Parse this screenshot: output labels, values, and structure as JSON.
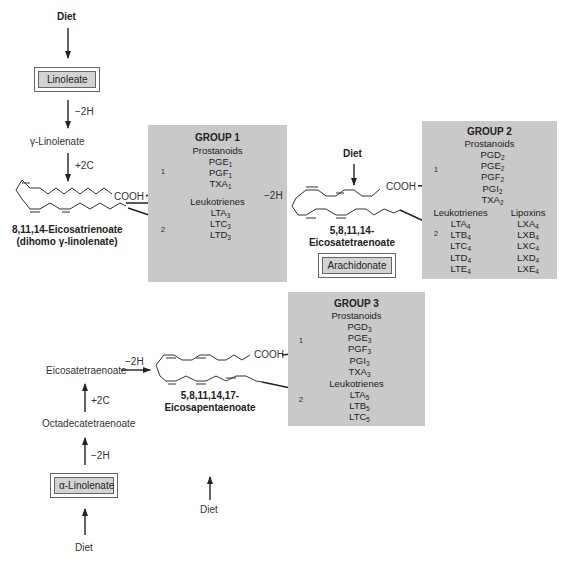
{
  "pathway_1": {
    "diet_top": "Diet",
    "linoleate": "Linoleate",
    "step1": "−2H",
    "gamma_linolenate": "γ-Linolenate",
    "step2": "+2C",
    "cooh": "COOH",
    "molecule_name_1": "8,11,14-Eicosatrienoate",
    "molecule_name_2": "(dihomo γ-linolenate)",
    "step3": "−2H"
  },
  "pathway_2": {
    "diet": "Diet",
    "cooh": "COOH",
    "molecule_name_1": "5,8,11,14-",
    "molecule_name_2": "Eicosatetraenoate",
    "arachidonate": "Arachidonate"
  },
  "pathway_3": {
    "diet_bottom": "Diet",
    "alpha_linolenate": "α-Linolenate",
    "step1": "−2H",
    "octadecatetraenoate": "Octadecatetraenoate",
    "step2": "+2C",
    "eicosatetraenoate": "Eicosatetraenoate",
    "step3": "−2H",
    "cooh": "COOH",
    "molecule_name_1": "5,8,11,14,17-",
    "molecule_name_2": "Eicosapentaenoate",
    "diet_mid": "Diet"
  },
  "route_labels": {
    "one": "1",
    "two": "2"
  },
  "group1": {
    "title": "GROUP 1",
    "prostanoids_label": "Prostanoids",
    "prostanoids": [
      {
        "base": "PGE",
        "sub": "1"
      },
      {
        "base": "PGF",
        "sub": "1"
      },
      {
        "base": "TXA",
        "sub": "1"
      }
    ],
    "leukotrienes_label": "Leukotrienes",
    "leukotrienes": [
      {
        "base": "LTA",
        "sub": "3"
      },
      {
        "base": "LTC",
        "sub": "3"
      },
      {
        "base": "LTD",
        "sub": "3"
      }
    ]
  },
  "group2": {
    "title": "GROUP 2",
    "prostanoids_label": "Prostanoids",
    "prostanoids": [
      {
        "base": "PGD",
        "sub": "2"
      },
      {
        "base": "PGE",
        "sub": "2"
      },
      {
        "base": "PGF",
        "sub": "2"
      },
      {
        "base": "PGI",
        "sub": "2"
      },
      {
        "base": "TXA",
        "sub": "2"
      }
    ],
    "leukotrienes_label": "Leukotrienes",
    "leukotrienes": [
      {
        "base": "LTA",
        "sub": "4"
      },
      {
        "base": "LTB",
        "sub": "4"
      },
      {
        "base": "LTC",
        "sub": "4"
      },
      {
        "base": "LTD",
        "sub": "4"
      },
      {
        "base": "LTE",
        "sub": "4"
      }
    ],
    "lipoxins_label": "Lipoxins",
    "lipoxins": [
      {
        "base": "LXA",
        "sub": "4"
      },
      {
        "base": "LXB",
        "sub": "4"
      },
      {
        "base": "LXC",
        "sub": "4"
      },
      {
        "base": "LXD",
        "sub": "4"
      },
      {
        "base": "LXE",
        "sub": "4"
      }
    ]
  },
  "group3": {
    "title": "GROUP 3",
    "prostanoids_label": "Prostanoids",
    "prostanoids": [
      {
        "base": "PGD",
        "sub": "3"
      },
      {
        "base": "PGE",
        "sub": "3"
      },
      {
        "base": "PGF",
        "sub": "3"
      },
      {
        "base": "PGI",
        "sub": "3"
      },
      {
        "base": "TXA",
        "sub": "3"
      }
    ],
    "leukotrienes_label": "Leukotrienes",
    "leukotrienes": [
      {
        "base": "LTA",
        "sub": "5"
      },
      {
        "base": "LTB",
        "sub": "5"
      },
      {
        "base": "LTC",
        "sub": "5"
      }
    ]
  },
  "colors": {
    "group_box": "#c9c9c9",
    "boxed_label": "#d3d3d3",
    "line": "#222222"
  }
}
